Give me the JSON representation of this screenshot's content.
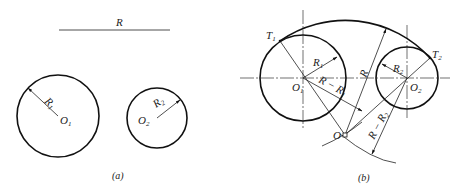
{
  "figure_a": {
    "caption": "(a)",
    "r_line_label": "R",
    "circle1": {
      "center_label": "O",
      "center_sub": "1",
      "radius_label": "R",
      "radius_sub": "1"
    },
    "circle2": {
      "center_label": "O",
      "center_sub": "2",
      "radius_label": "R",
      "radius_sub": "2"
    }
  },
  "figure_b": {
    "caption": "(b)",
    "t1_label": "T",
    "t1_sub": "1",
    "t2_label": "T",
    "t2_sub": "2",
    "o1_label": "O",
    "o1_sub": "1",
    "o2_label": "O",
    "o2_sub": "2",
    "o_label": "O",
    "r1_label": "R",
    "r1_sub": "1",
    "r2_label": "R",
    "r2_sub": "2",
    "r_label": "R",
    "r_minus_r1_label": "R − R",
    "r_minus_r1_sub": "1",
    "r_minus_r2_label": "R − R",
    "r_minus_r2_sub": "2"
  }
}
